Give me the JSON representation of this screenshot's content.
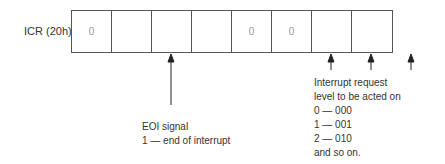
{
  "register": {
    "label": "ICR (20h)",
    "bits": [
      "0",
      "",
      "",
      "",
      "0",
      "0",
      "",
      ""
    ]
  },
  "annotations": {
    "eoi": {
      "lines": [
        "EOI signal",
        "1 — end of interrupt"
      ]
    },
    "level": {
      "lines": [
        "Interrupt request",
        "level to be acted on",
        "0 — 000",
        "1 — 001",
        "2 — 010",
        "and so on."
      ]
    }
  }
}
